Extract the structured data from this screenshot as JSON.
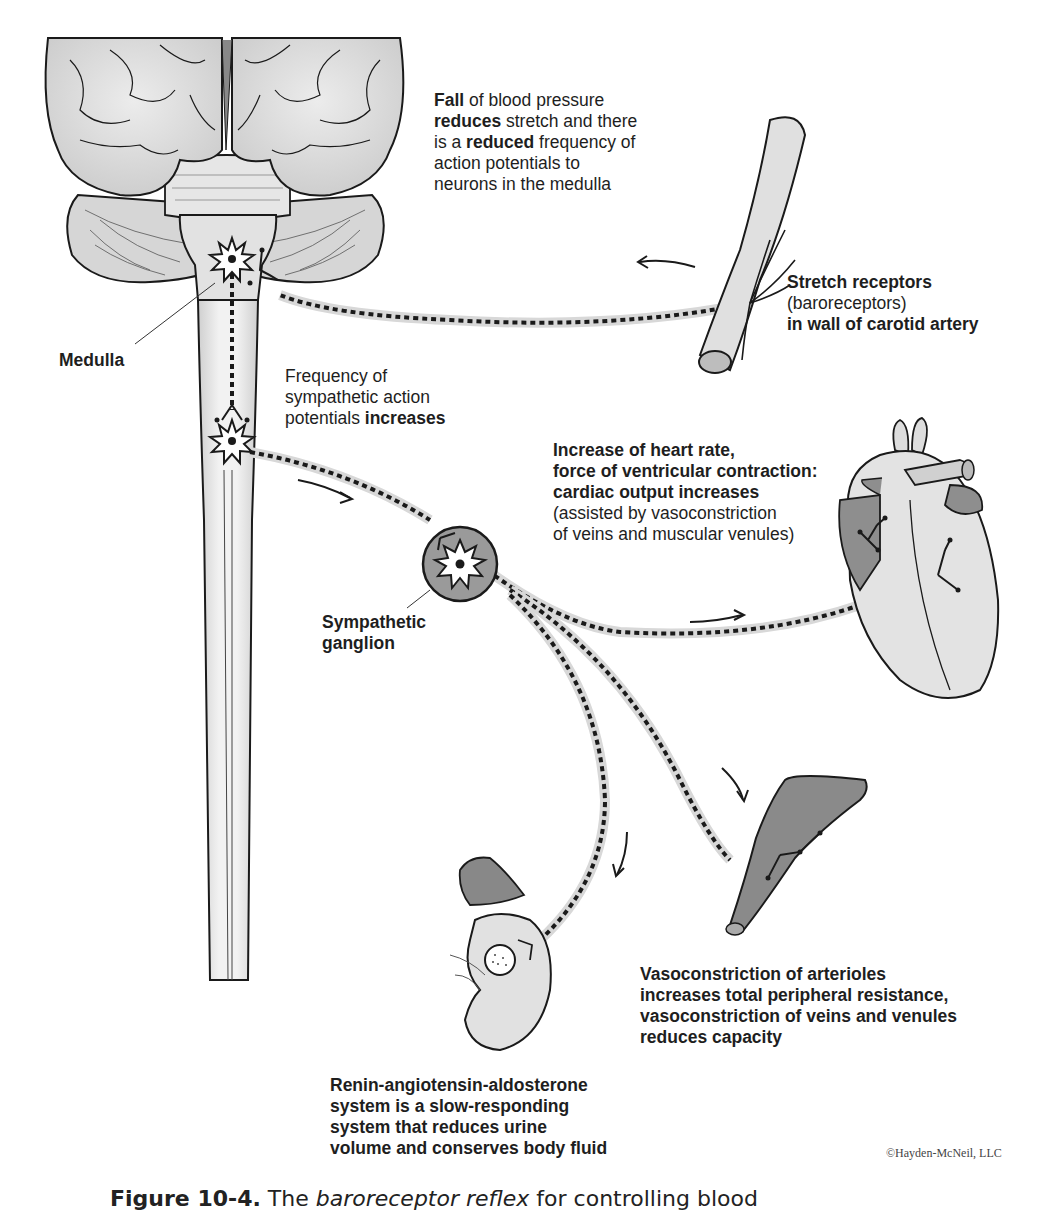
{
  "figure": {
    "caption_label": "Figure 10-4.",
    "caption_pre": " The ",
    "caption_italic": "baroreceptor reflex",
    "caption_post": " for controlling blood",
    "copyright": "©Hayden-McNeil, LLC"
  },
  "labels": {
    "fall_bp": {
      "line1_bold": "Fall",
      "line1_rest": " of blood pressure",
      "line2_bold": "reduces",
      "line2_rest": " stretch and there",
      "line3_pre": "is a ",
      "line3_bold": "reduced",
      "line3_rest": " frequency of",
      "line4": "action potentials to",
      "line5": "neurons in the medulla"
    },
    "stretch_receptors": {
      "line1": "Stretch receptors",
      "line2": "(baroreceptors)",
      "line3": "in wall of carotid artery"
    },
    "medulla": "Medulla",
    "sympathetic_freq": {
      "line1": "Frequency of",
      "line2": "sympathetic action",
      "line3_pre": "potentials ",
      "line3_bold": "increases"
    },
    "heart": {
      "line1": "Increase of heart rate,",
      "line2": "force of ventricular contraction:",
      "line3": "cardiac output increases",
      "line4": "(assisted by vasoconstriction",
      "line5": "of veins and muscular venules)"
    },
    "ganglion": {
      "line1": "Sympathetic",
      "line2": "ganglion"
    },
    "vasoconstriction": {
      "line1": "Vasoconstriction of arterioles",
      "line2": "increases total peripheral resistance,",
      "line3": "vasoconstriction of veins and venules",
      "line4": "reduces capacity"
    },
    "raas": {
      "line1": "Renin-angiotensin-aldosterone",
      "line2": "system is a slow-responding",
      "line3": "system that reduces urine",
      "line4": "volume and conserves body fluid"
    }
  },
  "structures": [
    "brain",
    "medulla",
    "spinal-cord",
    "carotid-artery",
    "sympathetic-ganglion",
    "heart",
    "arteriole",
    "kidney",
    "adrenal-gland"
  ],
  "colors": {
    "outline": "#1a1a1a",
    "fill_light": "#e4e4e4",
    "fill_mid": "#c8c8c8",
    "fill_dark": "#8c8c8c",
    "nerve_halo": "#d8d8d8"
  }
}
